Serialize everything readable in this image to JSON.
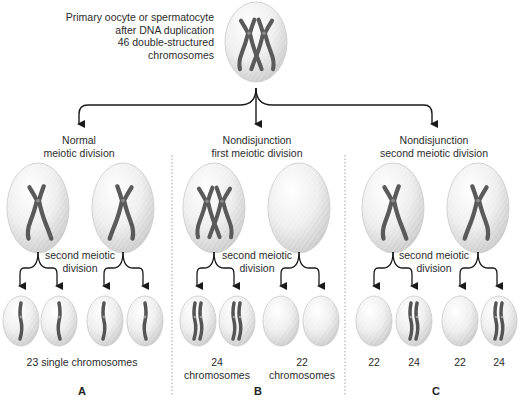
{
  "top": {
    "label_lines": [
      "Primary oocyte or spermatocyte",
      "after DNA duplication",
      "46 double-structured",
      "chromosomes"
    ]
  },
  "panels": [
    {
      "letter": "A",
      "title_lines": [
        "Normal",
        "meiotic division"
      ],
      "division_label_lines": [
        "second meiotic",
        "division"
      ],
      "first_division_cells": [
        {
          "chromosomes": "single-double-structured"
        },
        {
          "chromosomes": "single-double-structured"
        }
      ],
      "gametes": [
        {
          "chromosome_count": 23,
          "content": "single chromatid"
        },
        {
          "chromosome_count": 23,
          "content": "single chromatid"
        },
        {
          "chromosome_count": 23,
          "content": "single chromatid"
        },
        {
          "chromosome_count": 23,
          "content": "single chromatid"
        }
      ],
      "result_label": "23 single chromosomes"
    },
    {
      "letter": "B",
      "title_lines": [
        "Nondisjunction",
        "first meiotic division"
      ],
      "division_label_lines": [
        "second meiotic",
        "division"
      ],
      "first_division_cells": [
        {
          "chromosomes": "two double-structured"
        },
        {
          "chromosomes": "none"
        }
      ],
      "gametes": [
        {
          "chromosome_count": 24,
          "content": "two chromatids"
        },
        {
          "chromosome_count": 24,
          "content": "two chromatids"
        },
        {
          "chromosome_count": 22,
          "content": "empty"
        },
        {
          "chromosome_count": 22,
          "content": "empty"
        }
      ],
      "result_labels": [
        {
          "count": "24",
          "unit": "chromosomes"
        },
        {
          "count": "22",
          "unit": "chromosomes"
        }
      ]
    },
    {
      "letter": "C",
      "title_lines": [
        "Nondisjunction",
        "second meiotic division"
      ],
      "division_label_lines": [
        "second meiotic",
        "division"
      ],
      "first_division_cells": [
        {
          "chromosomes": "single-double-structured"
        },
        {
          "chromosomes": "single-double-structured"
        }
      ],
      "gametes": [
        {
          "chromosome_count": 22,
          "content": "empty"
        },
        {
          "chromosome_count": 24,
          "content": "two chromatids"
        },
        {
          "chromosome_count": 22,
          "content": "empty"
        },
        {
          "chromosome_count": 24,
          "content": "two chromatids"
        }
      ],
      "result_labels": [
        "22",
        "24",
        "22",
        "24"
      ]
    }
  ],
  "colors": {
    "chromosome": "#5a5a5a",
    "cell_fill": "#ececec",
    "cell_edge": "#bdbdbd",
    "arrow": "#1a1a1a",
    "divider": "#8a8a8a"
  }
}
